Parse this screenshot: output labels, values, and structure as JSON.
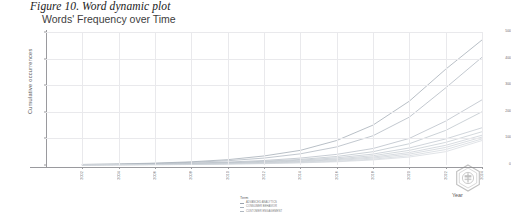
{
  "figure": {
    "caption": "Figure 10. Word dynamic plot"
  },
  "chart_data": {
    "type": "line",
    "title": "Words' Frequency over Time",
    "xlabel": "Year",
    "ylabel": "Cumulative occurrences",
    "grid": true,
    "legend_position": "bottom",
    "legend_title": "Term",
    "xlim": [
      2000,
      2024
    ],
    "ylim": [
      0,
      500
    ],
    "ytick_labels": [
      "500",
      "400",
      "300",
      "200",
      "100",
      "0"
    ],
    "ytick_values": [
      500,
      400,
      300,
      200,
      100,
      0
    ],
    "xtick_labels": [
      "2002",
      "2004",
      "2006",
      "2008",
      "2010",
      "2012",
      "2014",
      "2016",
      "2018",
      "2020",
      "2022",
      "2024"
    ],
    "x": [
      2002,
      2004,
      2006,
      2008,
      2010,
      2012,
      2014,
      2016,
      2018,
      2020,
      2022,
      2024
    ],
    "series": [
      {
        "name": "ADVANCED ANALYTICS",
        "color": "#9aa3ad",
        "values": [
          2,
          4,
          7,
          12,
          20,
          34,
          55,
          92,
          150,
          240,
          360,
          470
        ]
      },
      {
        "name": "CONSUMER BEHAVIOR",
        "color": "#a7b0ba",
        "values": [
          2,
          3,
          6,
          10,
          16,
          26,
          42,
          68,
          110,
          180,
          290,
          405
        ]
      },
      {
        "name": "CUSTOMER ENGAGEMENT",
        "color": "#b0b8c1",
        "values": [
          1,
          2,
          4,
          7,
          11,
          17,
          26,
          40,
          62,
          100,
          165,
          245
        ]
      },
      {
        "name": "DIGITAL TRANSFORMATION",
        "color": "#b6bec6",
        "values": [
          1,
          2,
          3,
          5,
          9,
          14,
          21,
          32,
          50,
          80,
          130,
          200
        ]
      },
      {
        "name": "MACHINE LEARNING",
        "color": "#bcc3cb",
        "values": [
          1,
          2,
          3,
          5,
          8,
          12,
          18,
          27,
          41,
          64,
          98,
          140
        ]
      },
      {
        "name": "BIG DATA",
        "color": "#c1c8cf",
        "values": [
          1,
          1,
          2,
          4,
          6,
          10,
          15,
          23,
          35,
          55,
          85,
          125
        ]
      },
      {
        "name": "SOCIAL MEDIA",
        "color": "#c6ccd3",
        "values": [
          1,
          1,
          2,
          3,
          5,
          8,
          13,
          20,
          30,
          47,
          74,
          112
        ]
      },
      {
        "name": "ARTIFICIAL INTELLIGENCE",
        "color": "#cad0d6",
        "values": [
          0,
          1,
          2,
          3,
          5,
          7,
          11,
          17,
          26,
          41,
          66,
          105
        ]
      },
      {
        "name": "VALUE CREATION",
        "color": "#ced4da",
        "values": [
          0,
          1,
          1,
          2,
          4,
          6,
          9,
          14,
          22,
          35,
          58,
          98
        ]
      },
      {
        "name": "BUSINESS MODEL",
        "color": "#d2d7dd",
        "values": [
          0,
          1,
          1,
          2,
          3,
          5,
          8,
          12,
          19,
          30,
          50,
          92
        ]
      }
    ]
  }
}
